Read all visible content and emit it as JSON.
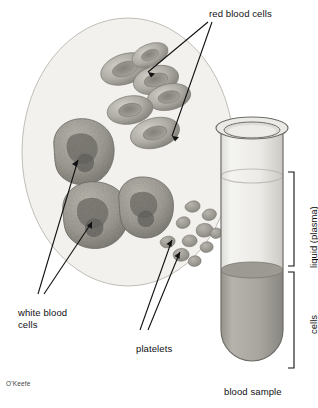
{
  "figure": {
    "title_visible": false,
    "signature": "O'Keefe",
    "background_color": "#ffffff",
    "line_color": "#111111"
  },
  "magnified_circle": {
    "name": "blood-smear-magnified-view",
    "fill_color": "#f2f1ee",
    "stroke_color": "#b9b6ae",
    "center_x": 128,
    "center_y": 152,
    "radius_x": 106,
    "radius_y": 134
  },
  "labels": {
    "red_blood_cells": "red blood cells",
    "white_blood_cells_line1": "white blood",
    "white_blood_cells_line2": "cells",
    "platelets": "platelets",
    "blood_sample": "blood sample",
    "liquid_plasma": "liquid (plasma)",
    "cells": "cells"
  },
  "cell_counts": {
    "red_blood_cells": 6,
    "white_blood_cells": 3,
    "platelets": 10
  },
  "test_tube": {
    "name": "blood-sample-test-tube",
    "plasma_color": "#e6e5e1",
    "cells_color": "#a9a7a0",
    "glass_stroke": "#6f6d68",
    "plasma_label": "liquid (plasma)",
    "cells_label": "cells",
    "caption": "blood sample"
  },
  "colors": {
    "rbc_fill": "#b3b0a9",
    "rbc_shade": "#8e8b84",
    "wbc_fill": "#a6a49c",
    "wbc_nucleus": "#6e6c66",
    "platelet_fill": "#a5a29b",
    "bracket": "#111111"
  }
}
